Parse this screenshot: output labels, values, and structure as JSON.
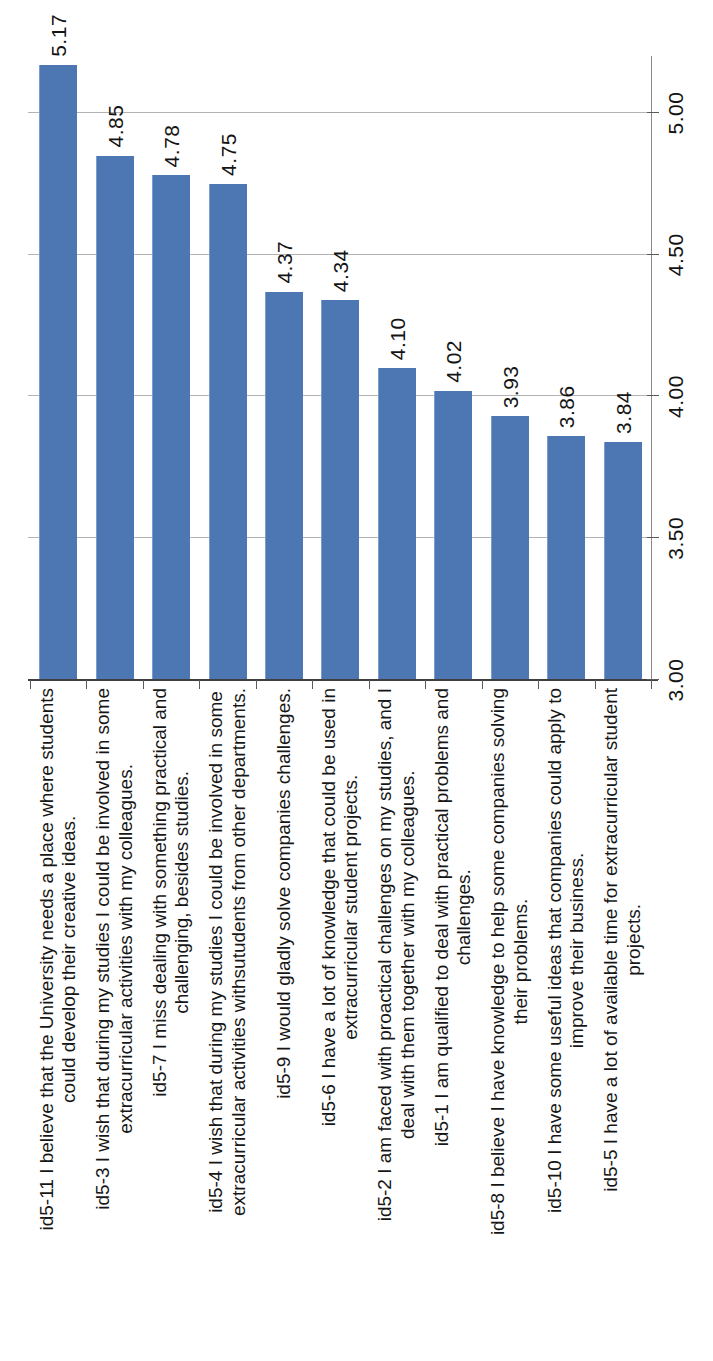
{
  "page": {
    "kind": "scanned-chart-page",
    "background": "#ffffff"
  },
  "chart_data": {
    "type": "bar",
    "orientation": "horizontal bars, whole chart rotated 90deg counter-clockwise on the page",
    "title": "",
    "xlabel": "",
    "ylabel": "",
    "legend_position": "none",
    "grid": true,
    "bar_color": "#4c77b3",
    "gridline_color": "#b3b3b3",
    "axis_line_color": "#3f3f3f",
    "text_color": "#141414",
    "axis": {
      "min": 3.0,
      "max": 5.2,
      "tick_interval": 0.5,
      "tick_values": [
        3.0,
        3.5,
        4.0,
        4.5,
        5.0
      ],
      "tick_labels": [
        "3.00",
        "3.50",
        "4.00",
        "4.50",
        "5.00"
      ]
    },
    "categories": [
      "id5-11 I believe that the University needs a place where students could develop their creative ideas.",
      "id5-3 I wish that during my studies I could be involved in some extracurricular activities with my colleagues.",
      "id5-7 I miss dealing with something practical and challenging, besides studies.",
      "id5-4 I wish that during my studies I could be involved in some extracurricular activities withsutudents from other departments.",
      "id5-9 I would gladly solve companies challenges.",
      "id5-6 I have a lot of knowledge that could be used in extracurricular student projects.",
      "id5-2 I am faced with proactical challenges on my studies, and I deal with them together with my colleagues.",
      "id5-1 I am qualified to deal with practical problems and challenges.",
      "id5-8 I believe I have knowledge to help some companies solving their problems.",
      "id5-10 I have some useful ideas that companies could apply to improve their business.",
      "id5-5 I have a lot of available time for extracurricular student projects."
    ],
    "category_lines": [
      [
        "id5-11 I believe that the University needs a place where students",
        "could develop their creative ideas."
      ],
      [
        "id5-3 I wish that during my studies I could be involved in some",
        "extracurricular activities with my colleagues."
      ],
      [
        "id5-7 I miss dealing with something practical and",
        "challenging, besides studies."
      ],
      [
        "id5-4 I wish that during my studies I could be involved in some",
        "extracurricular activities withsutudents from other departments."
      ],
      [
        "id5-9 I would gladly solve companies challenges."
      ],
      [
        "id5-6 I have a lot of knowledge that could be used in",
        "extracurricular student projects."
      ],
      [
        "id5-2 I am faced with proactical challenges on my studies, and I",
        "deal with them together with my colleagues."
      ],
      [
        "id5-1 I am qualified to deal with practical problems and",
        "challenges."
      ],
      [
        "id5-8 I believe I have knowledge to help some companies solving",
        "their problems."
      ],
      [
        "id5-10 I have some useful ideas that companies could apply to",
        "improve their business."
      ],
      [
        "id5-5 I have a lot of available time for extracurricular student",
        "projects."
      ]
    ],
    "values": [
      5.17,
      4.85,
      4.78,
      4.75,
      4.37,
      4.34,
      4.1,
      4.02,
      3.93,
      3.86,
      3.84
    ],
    "value_labels": [
      "5.17",
      "4.85",
      "4.78",
      "4.75",
      "4.37",
      "4.34",
      "4.10",
      "4.02",
      "3.93",
      "3.86",
      "3.84"
    ]
  }
}
